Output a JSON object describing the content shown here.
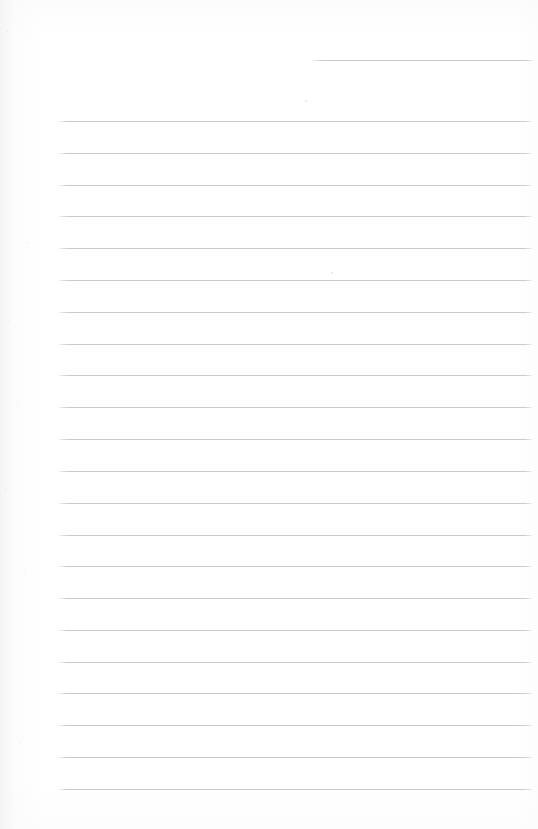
{
  "document": {
    "kind": "scanned-lined-paper",
    "title": "Blank ruled notebook page",
    "page_width": 538,
    "page_height": 829,
    "background_color": "#ffffff",
    "rule_color": "#c9c9cf",
    "rule_thickness_px": 1,
    "body_text": "",
    "visible_text": "",
    "notes": "No text, headings, numbers, icons or controls are present in the scan."
  },
  "header_rule": {
    "name": "header-rule",
    "x": 312,
    "y": 60,
    "width": 221,
    "color": "#c9c9cf"
  },
  "body_rules": {
    "count": 22,
    "left_x": 58,
    "right_x": 532,
    "width": 474,
    "first_y": 121,
    "spacing": 31.9,
    "y_positions": [
      121,
      153,
      185,
      216,
      248,
      280,
      312,
      344,
      375,
      407,
      439,
      471,
      503,
      535,
      566,
      598,
      630,
      662,
      693,
      725,
      757,
      789
    ],
    "color": "#c9c9cf"
  },
  "specks": [
    {
      "x": 331,
      "y": 272
    },
    {
      "x": 305,
      "y": 100
    }
  ]
}
